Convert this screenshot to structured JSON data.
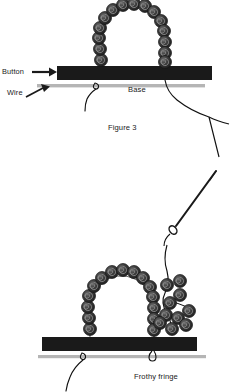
{
  "figure": {
    "caption": "Figure 3",
    "lower_caption": "Frothy fringe"
  },
  "labels": {
    "button": "Button",
    "wire": "Wire",
    "base": "Base"
  },
  "colors": {
    "bead_dark": "#2b2b2b",
    "bead_mid": "#4a4a4a",
    "bead_light": "#6e6e6e",
    "bar": "#1a1a1a",
    "wire_line": "#b5b5b5",
    "thread": "#111111",
    "text": "#1a1a1a",
    "background": "#ffffff"
  },
  "top_figure": {
    "bar": {
      "x": 57,
      "y": 66,
      "width": 155,
      "height": 14
    },
    "wire": {
      "x1": 37,
      "y1": 86,
      "x2": 205,
      "y2": 86
    },
    "arch_beads": [
      {
        "cx": 101,
        "cy": 60,
        "r": 6.4
      },
      {
        "cx": 100,
        "cy": 49,
        "r": 6.6
      },
      {
        "cx": 99,
        "cy": 38,
        "r": 6.6
      },
      {
        "cx": 100,
        "cy": 28,
        "r": 6.4
      },
      {
        "cx": 105,
        "cy": 18,
        "r": 6.4
      },
      {
        "cx": 113,
        "cy": 10,
        "r": 6.4
      },
      {
        "cx": 123,
        "cy": 5,
        "r": 6.4
      },
      {
        "cx": 134,
        "cy": 4,
        "r": 6.4
      },
      {
        "cx": 145,
        "cy": 6,
        "r": 6.4
      },
      {
        "cx": 154,
        "cy": 12,
        "r": 6.4
      },
      {
        "cx": 161,
        "cy": 21,
        "r": 6.4
      },
      {
        "cx": 164,
        "cy": 31,
        "r": 6.4
      },
      {
        "cx": 165,
        "cy": 42,
        "r": 6.4
      },
      {
        "cx": 165,
        "cy": 53,
        "r": 6.4
      },
      {
        "cx": 165,
        "cy": 62,
        "r": 6.2
      }
    ]
  },
  "needle": {
    "tip": {
      "x": 215,
      "y": 172
    },
    "eye": {
      "x": 172,
      "y": 230
    }
  },
  "lower_figure": {
    "bar": {
      "x": 42,
      "y": 337,
      "width": 155,
      "height": 14
    },
    "wire": {
      "x1": 58,
      "y1": 357,
      "x2": 196,
      "y2": 357
    },
    "arch_beads": [
      {
        "cx": 90,
        "cy": 329,
        "r": 6.6
      },
      {
        "cx": 89,
        "cy": 318,
        "r": 6.6
      },
      {
        "cx": 88,
        "cy": 307,
        "r": 6.6
      },
      {
        "cx": 89,
        "cy": 296,
        "r": 6.6
      },
      {
        "cx": 94,
        "cy": 286,
        "r": 6.6
      },
      {
        "cx": 102,
        "cy": 278,
        "r": 6.6
      },
      {
        "cx": 112,
        "cy": 272,
        "r": 6.6
      },
      {
        "cx": 123,
        "cy": 270,
        "r": 6.6
      },
      {
        "cx": 134,
        "cy": 272,
        "r": 6.6
      },
      {
        "cx": 143,
        "cy": 278,
        "r": 6.6
      },
      {
        "cx": 150,
        "cy": 287,
        "r": 6.6
      },
      {
        "cx": 153,
        "cy": 297,
        "r": 6.6
      },
      {
        "cx": 154,
        "cy": 308,
        "r": 6.6
      },
      {
        "cx": 154,
        "cy": 319,
        "r": 6.6
      },
      {
        "cx": 154,
        "cy": 330,
        "r": 6.4
      }
    ],
    "fringe_beads": [
      {
        "cx": 167,
        "cy": 285,
        "r": 6.6
      },
      {
        "cx": 180,
        "cy": 281,
        "r": 6.6
      },
      {
        "cx": 180,
        "cy": 295,
        "r": 6.6
      },
      {
        "cx": 170,
        "cy": 303,
        "r": 6.6
      },
      {
        "cx": 166,
        "cy": 315,
        "r": 6.6
      },
      {
        "cx": 178,
        "cy": 318,
        "r": 6.6
      },
      {
        "cx": 189,
        "cy": 311,
        "r": 6.6
      },
      {
        "cx": 186,
        "cy": 325,
        "r": 6.6
      },
      {
        "cx": 172,
        "cy": 329,
        "r": 6.6
      },
      {
        "cx": 160,
        "cy": 323,
        "r": 6.2
      }
    ]
  }
}
